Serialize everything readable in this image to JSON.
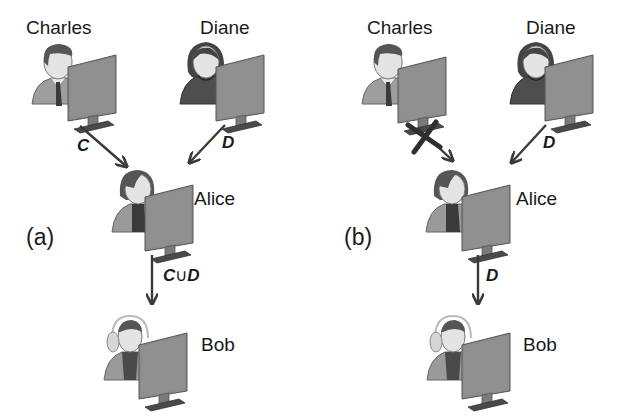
{
  "panels": [
    {
      "id": "a",
      "label": "(a)",
      "people": {
        "charles": "Charles",
        "diane": "Diane",
        "alice": "Alice",
        "bob": "Bob"
      },
      "edges": {
        "charles_to_alice": {
          "label": "C",
          "blocked": false
        },
        "diane_to_alice": {
          "label": "D",
          "blocked": false
        },
        "alice_to_bob": {
          "label_left": "C",
          "union": "∪",
          "label_right": "D"
        }
      }
    },
    {
      "id": "b",
      "label": "(b)",
      "people": {
        "charles": "Charles",
        "diane": "Diane",
        "alice": "Alice",
        "bob": "Bob"
      },
      "edges": {
        "charles_to_alice": {
          "label": "",
          "blocked": true
        },
        "diane_to_alice": {
          "label": "D",
          "blocked": false
        },
        "alice_to_bob": {
          "label": "D"
        }
      }
    }
  ],
  "colors": {
    "arrow": "#3a3a3a",
    "monitor": "#8c8c8c",
    "skin": "#e2e2e2",
    "hair": "#5a5a5a",
    "body_light": "#9a9a9a",
    "body_dark": "#5e5e5e"
  }
}
